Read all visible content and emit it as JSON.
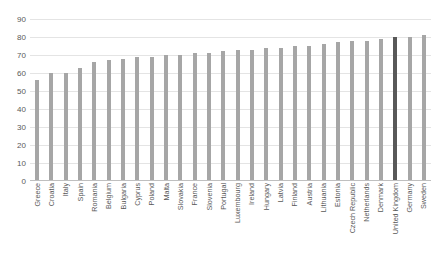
{
  "chart_data": {
    "type": "bar",
    "title": "",
    "subtitle": "",
    "xlabel": "",
    "ylabel": "",
    "ylim": [
      0,
      90
    ],
    "ytick_step": 10,
    "yticks": [
      90,
      80,
      70,
      60,
      50,
      40,
      30,
      20,
      10,
      0
    ],
    "grid": true,
    "legend": null,
    "orientation": "vertical",
    "bar_color": "#a6a6a6",
    "highlight_color": "#585858",
    "highlight_category": "United Kingdom",
    "categories": [
      "Greece",
      "Croatia",
      "Italy",
      "Spain",
      "Romania",
      "Belgium",
      "Bulgaria",
      "Cyprus",
      "Poland",
      "Malta",
      "Slovakia",
      "France",
      "Slovenia",
      "Portugal",
      "Luxembourg",
      "Ireland",
      "Hungary",
      "Latvia",
      "Finland",
      "Austria",
      "Lithuania",
      "Estonia",
      "Czech Republic",
      "Netherlands",
      "Denmark",
      "United Kingdom",
      "Germany",
      "Sweden"
    ],
    "values": [
      56,
      60,
      60,
      63,
      66,
      67,
      68,
      69,
      69,
      70,
      70,
      71,
      71,
      72,
      73,
      73,
      74,
      74,
      75,
      75,
      76,
      77,
      78,
      78,
      79,
      80,
      80,
      81
    ]
  }
}
